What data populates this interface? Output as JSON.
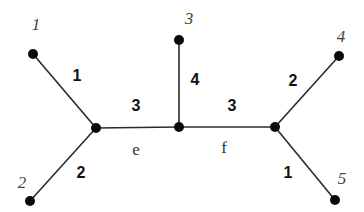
{
  "diagram": {
    "type": "phylogenetic-tree",
    "nodes": [
      {
        "id": "leaf1",
        "label": "1",
        "x": 33,
        "y": 54,
        "lx": 36,
        "ly": 30
      },
      {
        "id": "leaf2",
        "label": "2",
        "x": 30,
        "y": 201,
        "lx": 22,
        "ly": 188
      },
      {
        "id": "leaf3",
        "label": "3",
        "x": 179,
        "y": 40,
        "lx": 189,
        "ly": 24
      },
      {
        "id": "leaf4",
        "label": "4",
        "x": 339,
        "y": 56,
        "lx": 341,
        "ly": 42
      },
      {
        "id": "leaf5",
        "label": "5",
        "x": 335,
        "y": 200,
        "lx": 342,
        "ly": 184
      },
      {
        "id": "int1",
        "label": "",
        "x": 96,
        "y": 128
      },
      {
        "id": "int2",
        "label": "",
        "x": 179,
        "y": 127
      },
      {
        "id": "int3",
        "label": "",
        "x": 275,
        "y": 127
      }
    ],
    "edges": [
      {
        "from": "leaf1",
        "to": "int1",
        "weight": "1",
        "wx": 77,
        "wy": 81
      },
      {
        "from": "leaf2",
        "to": "int1",
        "weight": "2",
        "wx": 81,
        "wy": 178
      },
      {
        "from": "int1",
        "to": "int2",
        "weight": "3",
        "name": "e",
        "wx": 136,
        "wy": 111,
        "nx": 136,
        "ny": 155
      },
      {
        "from": "leaf3",
        "to": "int2",
        "weight": "4",
        "wx": 195,
        "wy": 85
      },
      {
        "from": "int2",
        "to": "int3",
        "weight": "3",
        "name": "f",
        "wx": 232,
        "wy": 111,
        "nx": 224,
        "ny": 153
      },
      {
        "from": "leaf4",
        "to": "int3",
        "weight": "2",
        "wx": 293,
        "wy": 86
      },
      {
        "from": "leaf5",
        "to": "int3",
        "weight": "1",
        "wx": 288,
        "wy": 178
      }
    ]
  }
}
